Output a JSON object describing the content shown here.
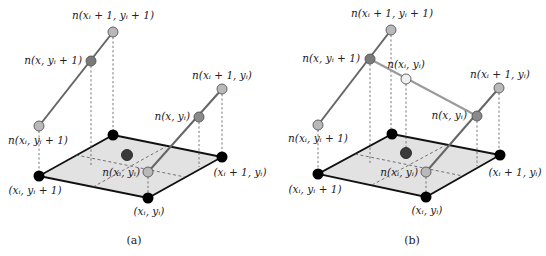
{
  "figure": {
    "panels": [
      {
        "id": "a",
        "caption": "(a)",
        "caption_pos": [
          134,
          244
        ],
        "plane_corners": {
          "back": [
            113,
            135
          ],
          "right": [
            222,
            157
          ],
          "front": [
            148,
            198
          ],
          "left": [
            39,
            176
          ]
        },
        "plane_dashed_lines": [
          [
            [
              76,
              155
            ],
            [
              185,
              177
            ]
          ],
          [
            [
              93,
              187
            ],
            [
              167,
              146
            ]
          ]
        ],
        "points": [
          {
            "name": "n-xi1-yi1",
            "pos": [
              113,
              32
            ],
            "fill": "#b9b9b9",
            "r": 5
          },
          {
            "name": "n-x-yi1",
            "pos": [
              91,
              61
            ],
            "fill": "#7a7a7a",
            "r": 5
          },
          {
            "name": "n-xi-yi1",
            "pos": [
              39,
              126
            ],
            "fill": "#b9b9b9",
            "r": 5
          },
          {
            "name": "n-xi1-yi",
            "pos": [
              222,
              89
            ],
            "fill": "#b9b9b9",
            "r": 5
          },
          {
            "name": "n-x-yi",
            "pos": [
              199,
              117
            ],
            "fill": "#8a8a8a",
            "r": 5
          },
          {
            "name": "n-xi-yi",
            "pos": [
              148,
              172
            ],
            "fill": "#b9b9b9",
            "r": 5
          },
          {
            "name": "center-point",
            "pos": [
              127,
              155
            ],
            "fill": "#3a3a3a",
            "r": 5.5
          }
        ],
        "corner_points": [
          [
            113,
            135
          ],
          [
            222,
            157
          ],
          [
            148,
            198
          ],
          [
            39,
            176
          ]
        ],
        "interp_lines": [
          {
            "from": [
              113,
              32
            ],
            "to": [
              39,
              126
            ],
            "style": "dark"
          },
          {
            "from": [
              222,
              89
            ],
            "to": [
              148,
              172
            ],
            "style": "dark"
          }
        ],
        "drop_lines": [
          [
            [
              113,
              37
            ],
            [
              113,
              130
            ]
          ],
          [
            [
              91,
              66
            ],
            [
              91,
              165
            ]
          ],
          [
            [
              39,
              131
            ],
            [
              39,
              171
            ]
          ],
          [
            [
              222,
              94
            ],
            [
              222,
              152
            ]
          ],
          [
            [
              199,
              122
            ],
            [
              199,
              167
            ]
          ],
          [
            [
              148,
              177
            ],
            [
              148,
              193
            ]
          ]
        ],
        "labels": [
          {
            "text": "n(xᵢ + 1, yᵢ + 1)",
            "x": 113,
            "y": 19,
            "anchor": "middle"
          },
          {
            "text": "n(x, yᵢ + 1)",
            "x": 82,
            "y": 64,
            "anchor": "end"
          },
          {
            "text": "n(xᵢ + 1, yᵢ)",
            "x": 222,
            "y": 79,
            "anchor": "middle"
          },
          {
            "text": "n(x, yᵢ)",
            "x": 190,
            "y": 120,
            "anchor": "end"
          },
          {
            "text": "n(xᵢ, yᵢ + 1)",
            "x": 38,
            "y": 144,
            "anchor": "middle"
          },
          {
            "text": "n(xᵢ, yᵢ)",
            "x": 140,
            "y": 176,
            "anchor": "end"
          },
          {
            "text": "(xᵢ, yᵢ + 1)",
            "x": 35,
            "y": 194,
            "anchor": "middle"
          },
          {
            "text": "(xᵢ + 1, yᵢ)",
            "x": 240,
            "y": 176,
            "anchor": "middle"
          },
          {
            "text": "(xᵢ, yᵢ)",
            "x": 149,
            "y": 215,
            "anchor": "middle"
          }
        ]
      },
      {
        "id": "b",
        "caption": "(b)",
        "caption_pos": [
          412,
          244
        ],
        "plane_corners": {
          "back": [
            392,
            134
          ],
          "right": [
            500,
            155
          ],
          "front": [
            426,
            197
          ],
          "left": [
            318,
            174
          ]
        },
        "plane_dashed_lines": [
          [
            [
              355,
              154
            ],
            [
              463,
              176
            ]
          ],
          [
            [
              372,
              185
            ],
            [
              446,
              145
            ]
          ]
        ],
        "points": [
          {
            "name": "n-xi1-yi1",
            "pos": [
              391,
              30
            ],
            "fill": "#b9b9b9",
            "r": 5
          },
          {
            "name": "n-x-yi1",
            "pos": [
              370,
              59
            ],
            "fill": "#7a7a7a",
            "r": 5
          },
          {
            "name": "n-xi-yi1",
            "pos": [
              318,
              125
            ],
            "fill": "#b9b9b9",
            "r": 5
          },
          {
            "name": "n-xi-yi-interp",
            "pos": [
              406,
              79
            ],
            "fill": "#f0f0f0",
            "r": 5
          },
          {
            "name": "n-xi1-yi",
            "pos": [
              499,
              88
            ],
            "fill": "#b9b9b9",
            "r": 5
          },
          {
            "name": "n-x-yi",
            "pos": [
              477,
              116
            ],
            "fill": "#8a8a8a",
            "r": 5
          },
          {
            "name": "n-xi-yi",
            "pos": [
              426,
              172
            ],
            "fill": "#b9b9b9",
            "r": 5
          },
          {
            "name": "center-point",
            "pos": [
              406,
              153
            ],
            "fill": "#3a3a3a",
            "r": 5.5
          }
        ],
        "corner_points": [
          [
            392,
            134
          ],
          [
            500,
            155
          ],
          [
            426,
            197
          ],
          [
            318,
            174
          ]
        ],
        "interp_lines": [
          {
            "from": [
              391,
              30
            ],
            "to": [
              318,
              125
            ],
            "style": "dark"
          },
          {
            "from": [
              499,
              88
            ],
            "to": [
              426,
              172
            ],
            "style": "dark"
          },
          {
            "from": [
              370,
              59
            ],
            "to": [
              477,
              116
            ],
            "style": "light"
          }
        ],
        "drop_lines": [
          [
            [
              391,
              35
            ],
            [
              391,
              129
            ]
          ],
          [
            [
              370,
              64
            ],
            [
              370,
              164
            ]
          ],
          [
            [
              406,
              84
            ],
            [
              406,
              148
            ]
          ],
          [
            [
              318,
              130
            ],
            [
              318,
              169
            ]
          ],
          [
            [
              499,
              93
            ],
            [
              499,
              150
            ]
          ],
          [
            [
              477,
              121
            ],
            [
              477,
              166
            ]
          ],
          [
            [
              426,
              177
            ],
            [
              426,
              192
            ]
          ]
        ],
        "labels": [
          {
            "text": "n(xᵢ + 1, yᵢ + 1)",
            "x": 392,
            "y": 17,
            "anchor": "middle"
          },
          {
            "text": "n(x, yᵢ + 1)",
            "x": 360,
            "y": 62,
            "anchor": "end"
          },
          {
            "text": "n(xᵢ, yᵢ)",
            "x": 406,
            "y": 68,
            "anchor": "middle"
          },
          {
            "text": "n(xᵢ + 1, yᵢ)",
            "x": 500,
            "y": 78,
            "anchor": "middle"
          },
          {
            "text": "n(x, yᵢ)",
            "x": 467,
            "y": 119,
            "anchor": "end"
          },
          {
            "text": "n(xᵢ, yᵢ + 1)",
            "x": 318,
            "y": 142,
            "anchor": "middle"
          },
          {
            "text": "n(xᵢ, yᵢ)",
            "x": 418,
            "y": 176,
            "anchor": "end"
          },
          {
            "text": "(xᵢ, yᵢ + 1)",
            "x": 315,
            "y": 193,
            "anchor": "middle"
          },
          {
            "text": "(xᵢ + 1, yᵢ)",
            "x": 515,
            "y": 176,
            "anchor": "middle"
          },
          {
            "text": "(xᵢ, yᵢ)",
            "x": 427,
            "y": 214,
            "anchor": "middle"
          }
        ]
      }
    ],
    "colors": {
      "plane_fill": "#e2e2e2",
      "plane_edge": "#111111",
      "corner_point": "#000000",
      "point_stroke": "#555555",
      "interp_dark": "#666666",
      "interp_light": "#9a9a9a"
    }
  }
}
